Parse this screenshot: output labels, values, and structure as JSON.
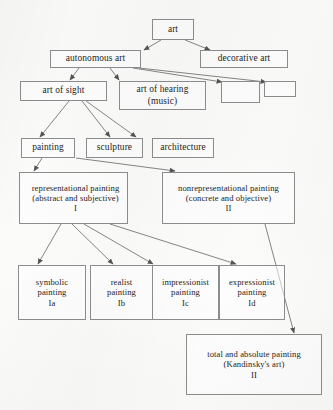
{
  "diagram": {
    "background_color": "#fbfbfa",
    "line_color": "#6f6f6f",
    "box_border_color": "#8d8d8d",
    "text_color": "#1d1d1d",
    "nodes": [
      {
        "id": "art",
        "label": "art"
      },
      {
        "id": "autonomous",
        "label": "autonomous art"
      },
      {
        "id": "decorative",
        "label": "decorative art"
      },
      {
        "id": "sight",
        "label": "art of sight"
      },
      {
        "id": "hearing",
        "label": "art of hearing\n(music)"
      },
      {
        "id": "empty1",
        "label": ""
      },
      {
        "id": "empty2",
        "label": ""
      },
      {
        "id": "painting",
        "label": "painting"
      },
      {
        "id": "sculpture",
        "label": "sculpture"
      },
      {
        "id": "architecture",
        "label": "architecture"
      },
      {
        "id": "representational",
        "label": "representational painting\n(abstract and subjective)\nI"
      },
      {
        "id": "nonrepresentational",
        "label": "nonrepresentational painting\n(concrete and objective)\nII"
      },
      {
        "id": "symbolic",
        "label": "symbolic\npainting\nIa"
      },
      {
        "id": "realist",
        "label": "realist\npainting\nIb"
      },
      {
        "id": "impressionist",
        "label": "impressionist\npainting\nIc"
      },
      {
        "id": "expressionist",
        "label": "expressionist\npainting\nId"
      },
      {
        "id": "total",
        "label": "total and absolute painting\n(Kandinsky's art)\nII"
      }
    ],
    "edges": [
      {
        "from": "art",
        "to": "autonomous"
      },
      {
        "from": "art",
        "to": "decorative"
      },
      {
        "from": "autonomous",
        "to": "sight"
      },
      {
        "from": "autonomous",
        "to": "hearing"
      },
      {
        "from": "autonomous",
        "to": "empty1"
      },
      {
        "from": "autonomous",
        "to": "empty2"
      },
      {
        "from": "sight",
        "to": "painting"
      },
      {
        "from": "sight",
        "to": "sculpture"
      },
      {
        "from": "sight",
        "to": "architecture"
      },
      {
        "from": "painting",
        "to": "representational"
      },
      {
        "from": "painting",
        "to": "nonrepresentational"
      },
      {
        "from": "representational",
        "to": "symbolic"
      },
      {
        "from": "representational",
        "to": "realist"
      },
      {
        "from": "representational",
        "to": "impressionist"
      },
      {
        "from": "representational",
        "to": "expressionist"
      },
      {
        "from": "nonrepresentational",
        "to": "total"
      }
    ]
  }
}
